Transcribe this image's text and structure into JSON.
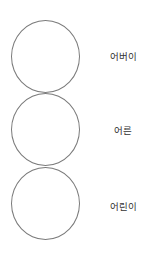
{
  "diagram": {
    "type": "stacked-circles",
    "stroke_color": "#7a7a7a",
    "text_color": "#333333",
    "items": [
      {
        "label": "어버이"
      },
      {
        "label": "어른"
      },
      {
        "label": "어린이"
      }
    ]
  }
}
